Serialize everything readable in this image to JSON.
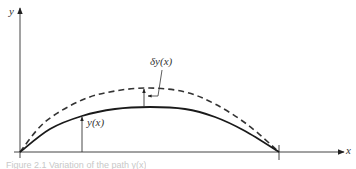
{
  "figure": {
    "caption": "Figure 2.1 Variation of the path y(x)",
    "caption_note": "Caption is clipped and not legible in the screenshot; this text is a best guess, not a verified reading."
  },
  "axes": {
    "x_label": "x",
    "y_label": "y",
    "origin": [
      20,
      152
    ],
    "x_axis_end": 344,
    "y_axis_top": 8
  },
  "curves": {
    "solid": {
      "name": "y(x)",
      "style": "solid",
      "color": "#1a1a1a",
      "points": [
        [
          20,
          152
        ],
        [
          50,
          129
        ],
        [
          82,
          116
        ],
        [
          115,
          109
        ],
        [
          150,
          107
        ],
        [
          185,
          109
        ],
        [
          215,
          117
        ],
        [
          245,
          131
        ],
        [
          279,
          152
        ]
      ]
    },
    "dashed": {
      "name": "y(x) + δy(x)",
      "style": "dashed",
      "color": "#333333",
      "points": [
        [
          20,
          152
        ],
        [
          45,
          122
        ],
        [
          82,
          100
        ],
        [
          115,
          91
        ],
        [
          150,
          88
        ],
        [
          185,
          92
        ],
        [
          215,
          104
        ],
        [
          248,
          125
        ],
        [
          279,
          152
        ]
      ]
    }
  },
  "annotations": {
    "y_of_x": {
      "label": "y(x)",
      "arrow_x": 82,
      "arrow_from_y": 152,
      "arrow_to_y": 117,
      "label_pos": [
        87,
        117
      ]
    },
    "delta_y": {
      "label": "δy(x)",
      "label_pos": [
        150,
        56
      ],
      "vertical_arrow_x": 144,
      "vertical_from_y": 107,
      "vertical_to_y": 89,
      "leader": [
        [
          162,
          70
        ],
        [
          158,
          96
        ],
        [
          148,
          96
        ]
      ]
    }
  },
  "end_tick": {
    "x": 279,
    "y_top": 145,
    "y_bottom": 160
  }
}
